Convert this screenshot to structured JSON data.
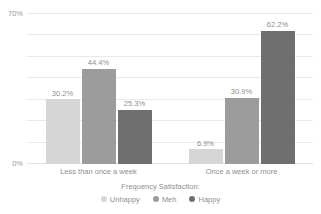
{
  "chart_data": {
    "type": "bar",
    "title": "",
    "subtitle": "",
    "xlabel": "",
    "ylabel": "",
    "categories": [
      "Less than once a week",
      "Once a week or more"
    ],
    "series": [
      {
        "name": "Unhappy",
        "color": "#d6d6d6",
        "values": [
          30.2,
          6.9
        ],
        "labels": [
          "30.2%",
          "6.9%"
        ]
      },
      {
        "name": "Meh",
        "color": "#9c9c9c",
        "values": [
          44.4,
          30.9
        ],
        "labels": [
          "44.4%",
          "30.9%"
        ]
      },
      {
        "name": "Happy",
        "color": "#6f6f6f",
        "values": [
          25.3,
          62.2
        ],
        "labels": [
          "25.3%",
          "62.2%"
        ]
      }
    ],
    "ylim": [
      0,
      70
    ],
    "y_ticks": [
      0,
      70
    ],
    "y_tick_labels": [
      "0%",
      "70%"
    ],
    "gridlines": [
      0,
      10,
      20,
      30,
      40,
      50,
      60,
      70
    ],
    "grid": true,
    "legend_title": "Frequency Satisfaction:",
    "legend_position": "bottom",
    "value_labels": true
  },
  "axis": {
    "y_top_label": "70%",
    "y_bottom_label": "0%"
  },
  "colors": {
    "unhappy": "#d6d6d6",
    "meh": "#9c9c9c",
    "happy": "#6f6f6f",
    "grid": "#e9e9e9",
    "text": "#8f8f8f",
    "background": "#ffffff"
  }
}
